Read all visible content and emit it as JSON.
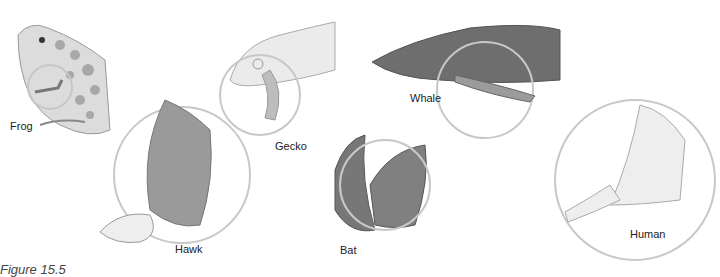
{
  "figure": {
    "caption": "Figure 15.5",
    "labels": {
      "frog": "Frog",
      "hawk": "Hawk",
      "gecko": "Gecko",
      "whale": "Whale",
      "bat": "Bat",
      "human": "Human"
    },
    "colors": {
      "circle": "#c8c8c8",
      "illustration": "#8a8a8a",
      "text": "#222222"
    }
  }
}
